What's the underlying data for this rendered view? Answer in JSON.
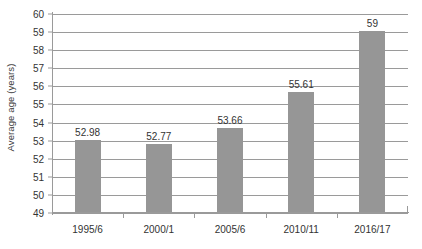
{
  "chart_data": {
    "type": "bar",
    "title": "",
    "subtitle": "",
    "xlabel": "",
    "ylabel": "Average age (years)",
    "categories": [
      "1995/6",
      "2000/1",
      "2005/6",
      "2010/11",
      "2016/17"
    ],
    "values": [
      52.98,
      52.77,
      53.66,
      55.61,
      59
    ],
    "data_labels": [
      "52.98",
      "52.77",
      "53.66",
      "55.61",
      "59"
    ],
    "ylim": [
      49,
      60
    ],
    "y_ticks": [
      60,
      59,
      58,
      57,
      56,
      55,
      54,
      53,
      52,
      51,
      50,
      49
    ],
    "y_tick_labels": [
      "60",
      "59",
      "58",
      "57",
      "56",
      "55",
      "54",
      "53",
      "52",
      "51",
      "50",
      "49"
    ],
    "grid": true,
    "grid_axis": "y",
    "legend": false,
    "legend_position": "none",
    "series": [
      {
        "name": "Average age (years)",
        "values": [
          52.98,
          52.77,
          53.66,
          55.61,
          59
        ],
        "color": "#969696"
      }
    ],
    "colors": {
      "bar_fill": "#969696",
      "gridline": "#9a9a9a",
      "axis": "#9a9a9a",
      "text": "#333333",
      "background": "#ffffff"
    }
  }
}
